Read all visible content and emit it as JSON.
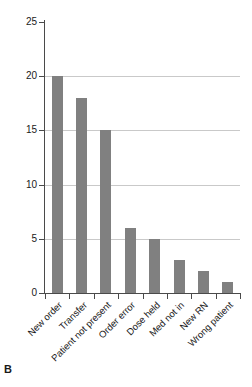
{
  "figure": {
    "panel_label": "B"
  },
  "chart_data": {
    "type": "bar",
    "title": "",
    "subtitle": "",
    "xlabel": "",
    "ylabel": "",
    "categories": [
      "New order",
      "Transfer",
      "Patient not present",
      "Order error",
      "Dose held",
      "Med not in",
      "New RN",
      "Wrong patient"
    ],
    "values": [
      20,
      18,
      15,
      6,
      5,
      3,
      2,
      1
    ],
    "ylim": [
      0,
      25
    ],
    "yticks": [
      0,
      5,
      10,
      15,
      20,
      25
    ],
    "ytick_labels": [
      "0",
      "5",
      "10",
      "15",
      "20",
      "25"
    ],
    "grid": true,
    "grid_axis": "y",
    "legend": null,
    "legend_position": "none",
    "bar_color": "#808080",
    "grid_color": "#c9c9c9",
    "axis_color": "#4a4a4a",
    "background_color": "#ffffff",
    "xtick_label_rotation": -45
  }
}
